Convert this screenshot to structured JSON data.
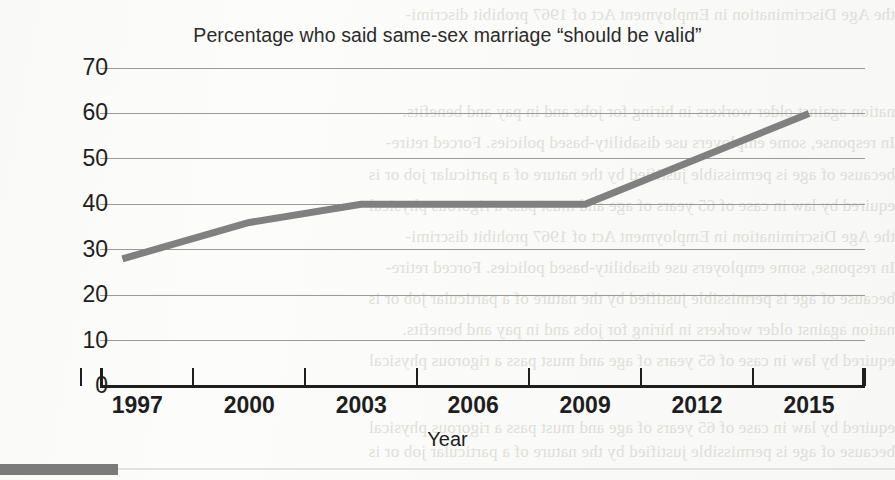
{
  "chart_data": {
    "type": "line",
    "title": "Percentage who said same-sex marriage “should be valid”",
    "xlabel": "Year",
    "ylabel": "",
    "xlim": [
      1996,
      2016.5
    ],
    "ylim": [
      0,
      70
    ],
    "grid": true,
    "legend": false,
    "yticks": [
      70,
      60,
      50,
      40,
      30,
      20,
      10,
      0
    ],
    "xticks": [
      1997,
      2000,
      2003,
      2006,
      2009,
      2012,
      2015
    ],
    "series": [
      {
        "name": "Should be valid",
        "color": "#808080",
        "x": [
          1996.6,
          2000.0,
          2003.0,
          2009.0,
          2015.0
        ],
        "values": [
          28,
          36,
          40,
          40,
          60
        ]
      }
    ],
    "points": [
      {
        "year": 1996.6,
        "value": 28
      },
      {
        "year": 2000.0,
        "value": 36
      },
      {
        "year": 2003.0,
        "value": 40
      },
      {
        "year": 2009.0,
        "value": 40
      },
      {
        "year": 2015.0,
        "value": 60
      }
    ]
  },
  "page": {
    "bleed_lines": [
      "the Age Discrimination in Employment Act of 1967 prohibit discrimi-",
      "nation against older workers in hiring for jobs and in pay and benefits.",
      "In response, some employers use disability-based policies. Forced retire-",
      "because of age is permissible justified by the nature of a particular job or is",
      "equired by law in case of 65 years of age and must pass a rigorous physical"
    ]
  }
}
